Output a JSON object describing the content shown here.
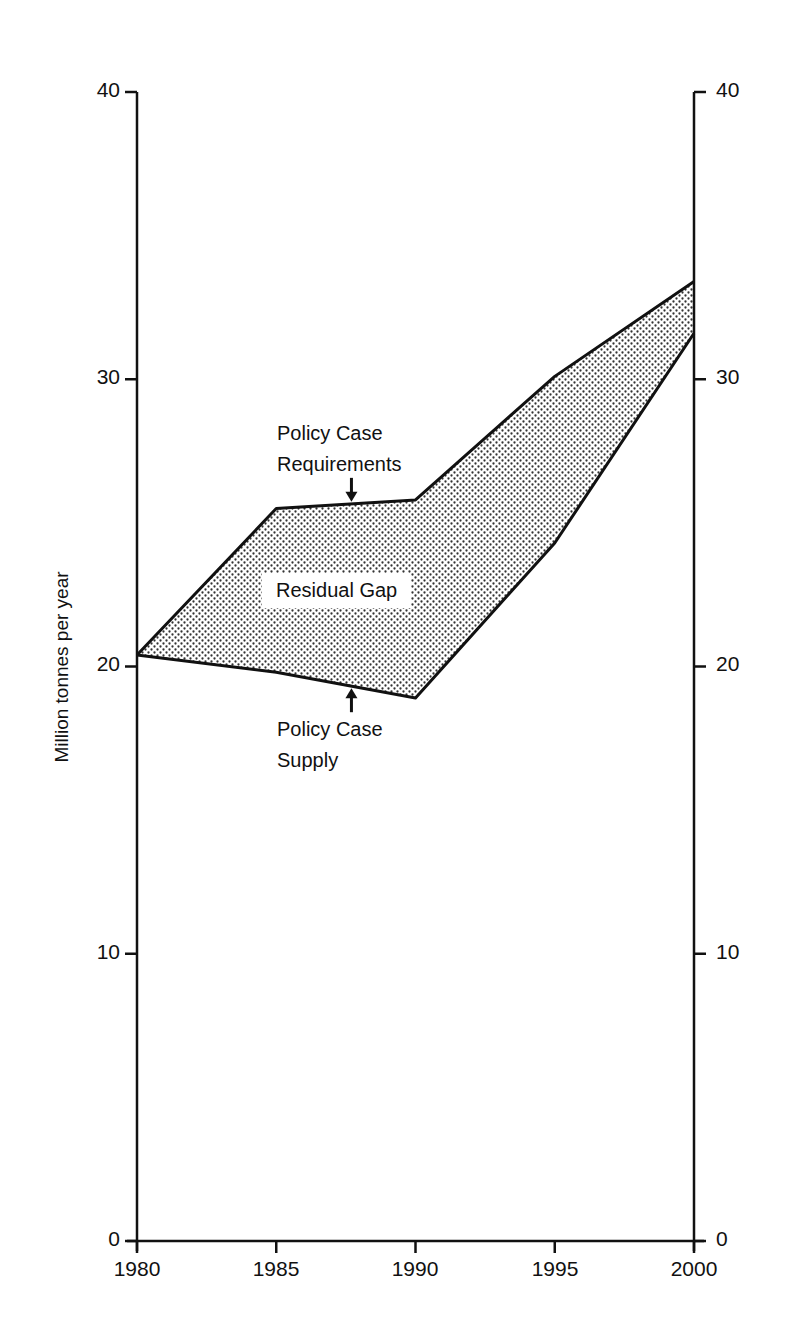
{
  "chart_data": {
    "type": "area",
    "title": "",
    "xlabel": "",
    "ylabel": "Million tonnes per year",
    "x": [
      1980,
      1985,
      1990,
      1995,
      2000
    ],
    "xticks": [
      "1980",
      "1985",
      "1990",
      "1995",
      "2000"
    ],
    "yticks": [
      "0",
      "10",
      "20",
      "30",
      "40"
    ],
    "ylim": [
      0,
      40
    ],
    "xlim": [
      1980,
      2000
    ],
    "grid": false,
    "dual_y_axis": true,
    "series": [
      {
        "name": "Policy Case Requirements",
        "values": [
          20.4,
          25.5,
          25.8,
          30.1,
          33.4
        ]
      },
      {
        "name": "Policy Case Supply",
        "values": [
          20.4,
          19.8,
          18.9,
          24.3,
          31.6
        ]
      }
    ],
    "shaded_region": {
      "label": "Residual Gap",
      "between": [
        "Policy Case Requirements",
        "Policy Case Supply"
      ],
      "fill": "stippled dots"
    },
    "annotations": [
      {
        "text_lines": [
          "Policy Case",
          "Requirements"
        ],
        "arrow_to": {
          "x": 1987.7,
          "series": "Policy Case Requirements"
        }
      },
      {
        "text_lines": [
          "Policy Case",
          "Supply"
        ],
        "arrow_to": {
          "x": 1987.7,
          "series": "Policy Case Supply"
        }
      },
      {
        "text": "Residual Gap"
      }
    ]
  },
  "labels": {
    "ylabel": "Million tonnes per year",
    "req_line1": "Policy Case",
    "req_line2": "Requirements",
    "sup_line1": "Policy Case",
    "sup_line2": "Supply",
    "gap": "Residual Gap"
  },
  "ticks": {
    "y": [
      "40",
      "30",
      "20",
      "10",
      "0"
    ],
    "x": [
      "1980",
      "1985",
      "1990",
      "1995",
      "2000"
    ]
  }
}
